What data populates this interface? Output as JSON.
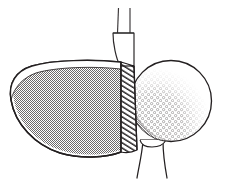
{
  "figure": {
    "title": "Golf driver clubhead striking a teed golf ball",
    "type": "line-drawing",
    "background_color": "#ffffff",
    "ink_color": "#231f20",
    "width": 226,
    "height": 189
  },
  "parts": {
    "shaft": {
      "name": "club shaft",
      "stroke_color": "#3a3638",
      "stroke_width": 1.1,
      "left_line_x": 118,
      "right_line_x": 130,
      "top_y": 8,
      "bottom_y": 32
    },
    "hosel": {
      "name": "hosel / neck",
      "stroke_color": "#2d2a2b",
      "fill_color": "#ffffff",
      "top_y": 32,
      "bottom_y": 66,
      "top_left_x": 112,
      "top_right_x": 132
    },
    "crown": {
      "name": "clubhead crown",
      "fill_color": "#ffffff",
      "stroke_color": "#231f20",
      "description": "white top band of the driver head"
    },
    "body": {
      "name": "clubhead body",
      "fill_pattern": "halftone-stipple-50",
      "fill_base_color": "#ffffff",
      "fill_dot_color": "#6d6a6b",
      "stroke_color": "#231f20",
      "stroke_width": 1.3
    },
    "face": {
      "name": "club face insert",
      "fill_pattern": "diagonal-hatch",
      "fill_base_color": "#ffffff",
      "hatch_color": "#2b2829",
      "hatch_angle_deg": 58,
      "hatch_spacing": 4,
      "stroke_color": "#231f20",
      "left_x": 120,
      "right_x": 140,
      "top_y": 60,
      "bottom_y": 150
    },
    "ball": {
      "name": "golf ball",
      "center_x": 171,
      "center_y": 101,
      "radius": 41,
      "fill_color": "#ffffff",
      "stroke_color": "#231f20",
      "stroke_width": 1.3,
      "dimples": {
        "name": "dimple shading",
        "pattern": "stippled-dimples",
        "shade_color": "#85807f",
        "region": "lower-left arc"
      }
    },
    "tee": {
      "name": "golf tee",
      "stroke_color": "#231f20",
      "stroke_width": 1.2,
      "fill_color": "#ffffff",
      "top_y": 140,
      "bottom_y": 178,
      "top_left_x": 143,
      "top_right_x": 163
    }
  },
  "labels": {
    "none_visible": ""
  }
}
